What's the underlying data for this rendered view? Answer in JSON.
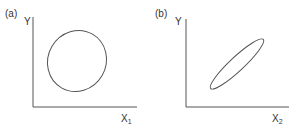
{
  "panels": [
    {
      "tag": "(a)",
      "y_label": "Y",
      "x_label": "X",
      "x_subscript": "1",
      "shape": "wide ellipse (weak correlation)"
    },
    {
      "tag": "(b)",
      "y_label": "Y",
      "x_label": "X",
      "x_subscript": "2",
      "shape": "narrow tilted ellipse (strong positive correlation)"
    }
  ],
  "colors": {
    "line": "#555555",
    "text": "#333333",
    "background": "#ffffff"
  }
}
